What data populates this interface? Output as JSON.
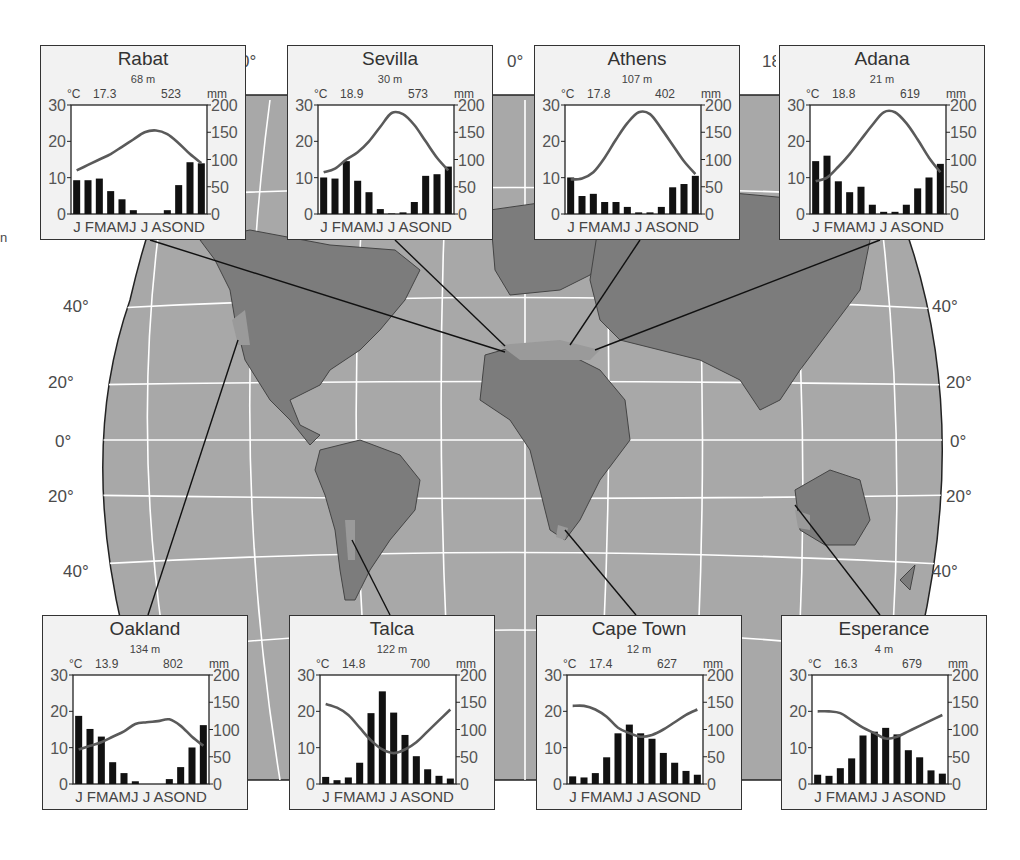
{
  "map": {
    "top_labels": [
      "0°",
      "0°",
      "18"
    ],
    "lat_labels_left": [
      "40°",
      "20°",
      "0°",
      "20°",
      "40°"
    ],
    "lat_labels_right": [
      "40°",
      "20°",
      "0°",
      "20°",
      "40°"
    ],
    "edge_fragment": "n",
    "colors": {
      "ocean": "#a8a8a8",
      "land": "#7c7c7c",
      "mediterranean_zone": "#9a9a9a",
      "grid": "#ffffff",
      "box_bg": "#f2f2f2",
      "bar": "#111111",
      "temp_line": "#5a5a5a"
    }
  },
  "chart_data": [
    {
      "type": "bar+line",
      "title": "Rabat",
      "elevation": "68 m",
      "annual_temp": "17.3",
      "annual_precip": "523",
      "temp_unit": "°C",
      "precip_unit": "mm",
      "categories": [
        "J",
        "F",
        "M",
        "A",
        "M",
        "J",
        "J",
        "A",
        "S",
        "O",
        "N",
        "D"
      ],
      "month_labels": "J FMAMJ J ASOND",
      "left_axis": {
        "label": "°C",
        "ticks": [
          0,
          10,
          20,
          30
        ],
        "range": [
          0,
          30
        ]
      },
      "right_axis": {
        "label": "mm",
        "ticks": [
          0,
          50,
          100,
          150,
          200
        ],
        "range": [
          0,
          200
        ]
      },
      "series": [
        {
          "name": "Precipitation (mm)",
          "type": "bar",
          "values": [
            62,
            62,
            65,
            42,
            27,
            7,
            0,
            0,
            7,
            53,
            95,
            93
          ]
        },
        {
          "name": "Temperature (°C)",
          "type": "line",
          "values": [
            12,
            13.5,
            15,
            16.5,
            18.5,
            20.5,
            22.5,
            23,
            22,
            19.5,
            16.5,
            14
          ]
        }
      ]
    },
    {
      "type": "bar+line",
      "title": "Sevilla",
      "elevation": "30 m",
      "annual_temp": "18.9",
      "annual_precip": "573",
      "temp_unit": "°C",
      "precip_unit": "mm",
      "categories": [
        "J",
        "F",
        "M",
        "A",
        "M",
        "J",
        "J",
        "A",
        "S",
        "O",
        "N",
        "D"
      ],
      "month_labels": "J FMAMJ J ASOND",
      "left_axis": {
        "label": "°C",
        "ticks": [
          0,
          10,
          20,
          30
        ],
        "range": [
          0,
          30
        ]
      },
      "right_axis": {
        "label": "mm",
        "ticks": [
          0,
          50,
          100,
          150,
          200
        ],
        "range": [
          0,
          200
        ]
      },
      "series": [
        {
          "name": "Precipitation (mm)",
          "type": "bar",
          "values": [
            67,
            65,
            97,
            61,
            40,
            9,
            1,
            3,
            22,
            70,
            73,
            87
          ]
        },
        {
          "name": "Temperature (°C)",
          "type": "line",
          "values": [
            11.5,
            12.5,
            15,
            17,
            20,
            24,
            27.8,
            27.5,
            24.5,
            20,
            15.5,
            12
          ]
        }
      ]
    },
    {
      "type": "bar+line",
      "title": "Athens",
      "elevation": "107 m",
      "annual_temp": "17.8",
      "annual_precip": "402",
      "temp_unit": "°C",
      "precip_unit": "mm",
      "categories": [
        "J",
        "F",
        "M",
        "A",
        "M",
        "J",
        "J",
        "A",
        "S",
        "O",
        "N",
        "D"
      ],
      "month_labels": "J FMAMJ J ASOND",
      "left_axis": {
        "label": "°C",
        "ticks": [
          0,
          10,
          20,
          30
        ],
        "range": [
          0,
          30
        ]
      },
      "right_axis": {
        "label": "mm",
        "ticks": [
          0,
          50,
          100,
          150,
          200
        ],
        "range": [
          0,
          200
        ]
      },
      "series": [
        {
          "name": "Precipitation (mm)",
          "type": "bar",
          "values": [
            67,
            33,
            37,
            22,
            22,
            13,
            3,
            3,
            13,
            49,
            55,
            70
          ]
        },
        {
          "name": "Temperature (°C)",
          "type": "line",
          "values": [
            9.5,
            9.8,
            11.5,
            15.5,
            20.5,
            25,
            28,
            27.5,
            23.5,
            19,
            14.5,
            11
          ]
        }
      ]
    },
    {
      "type": "bar+line",
      "title": "Adana",
      "elevation": "21 m",
      "annual_temp": "18.8",
      "annual_precip": "619",
      "temp_unit": "°C",
      "precip_unit": "mm",
      "categories": [
        "J",
        "F",
        "M",
        "A",
        "M",
        "J",
        "J",
        "A",
        "S",
        "O",
        "N",
        "D"
      ],
      "month_labels": "J FMAMJ J ASOND",
      "left_axis": {
        "label": "°C",
        "ticks": [
          0,
          10,
          20,
          30
        ],
        "range": [
          0,
          30
        ]
      },
      "right_axis": {
        "label": "mm",
        "ticks": [
          0,
          50,
          100,
          150,
          200
        ],
        "range": [
          0,
          200
        ]
      },
      "series": [
        {
          "name": "Precipitation (mm)",
          "type": "bar",
          "values": [
            97,
            107,
            60,
            40,
            50,
            17,
            4,
            4,
            17,
            47,
            67,
            92
          ]
        },
        {
          "name": "Temperature (°C)",
          "type": "line",
          "values": [
            9,
            10,
            13,
            16.5,
            20.5,
            24.5,
            28,
            28,
            25,
            20.5,
            15.5,
            11.5
          ]
        }
      ]
    },
    {
      "type": "bar+line",
      "title": "Oakland",
      "elevation": "134 m",
      "annual_temp": "13.9",
      "annual_precip": "802",
      "temp_unit": "°C",
      "precip_unit": "mm",
      "categories": [
        "J",
        "F",
        "M",
        "A",
        "M",
        "J",
        "J",
        "A",
        "S",
        "O",
        "N",
        "D"
      ],
      "month_labels": "J FMAMJ J ASOND",
      "left_axis": {
        "label": "°C",
        "ticks": [
          0,
          10,
          20,
          30
        ],
        "range": [
          0,
          30
        ]
      },
      "right_axis": {
        "label": "mm",
        "ticks": [
          0,
          50,
          100,
          150,
          200
        ],
        "range": [
          0,
          200
        ]
      },
      "series": [
        {
          "name": "Precipitation (mm)",
          "type": "bar",
          "values": [
            125,
            101,
            87,
            40,
            20,
            5,
            0,
            0,
            9,
            31,
            67,
            108
          ]
        },
        {
          "name": "Temperature (°C)",
          "type": "line",
          "values": [
            9.5,
            10.5,
            11.5,
            13,
            14.5,
            16.5,
            17,
            17.3,
            17.8,
            16,
            13,
            10.5
          ]
        }
      ]
    },
    {
      "type": "bar+line",
      "title": "Talca",
      "elevation": "122 m",
      "annual_temp": "14.8",
      "annual_precip": "700",
      "temp_unit": "°C",
      "precip_unit": "mm",
      "categories": [
        "J",
        "F",
        "M",
        "A",
        "M",
        "J",
        "J",
        "A",
        "S",
        "O",
        "N",
        "D"
      ],
      "month_labels": "J FMAMJ J ASOND",
      "left_axis": {
        "label": "°C",
        "ticks": [
          0,
          10,
          20,
          30
        ],
        "range": [
          0,
          30
        ]
      },
      "right_axis": {
        "label": "mm",
        "ticks": [
          0,
          50,
          100,
          150,
          200
        ],
        "range": [
          0,
          200
        ]
      },
      "series": [
        {
          "name": "Precipitation (mm)",
          "type": "bar",
          "values": [
            13,
            7,
            12,
            39,
            130,
            170,
            131,
            90,
            51,
            27,
            15,
            10
          ]
        },
        {
          "name": "Temperature (°C)",
          "type": "line",
          "values": [
            22,
            21,
            19,
            15.5,
            12,
            9.5,
            8.5,
            9.5,
            11.5,
            14.5,
            17.5,
            20.5
          ]
        }
      ]
    },
    {
      "type": "bar+line",
      "title": "Cape Town",
      "elevation": "12 m",
      "annual_temp": "17.4",
      "annual_precip": "627",
      "temp_unit": "°C",
      "precip_unit": "mm",
      "categories": [
        "J",
        "F",
        "M",
        "A",
        "M",
        "J",
        "J",
        "A",
        "S",
        "O",
        "N",
        "D"
      ],
      "month_labels": "J FMAMJ J ASOND",
      "left_axis": {
        "label": "°C",
        "ticks": [
          0,
          10,
          20,
          30
        ],
        "range": [
          0,
          30
        ]
      },
      "right_axis": {
        "label": "mm",
        "ticks": [
          0,
          50,
          100,
          150,
          200
        ],
        "range": [
          0,
          200
        ]
      },
      "series": [
        {
          "name": "Precipitation (mm)",
          "type": "bar",
          "values": [
            14,
            12,
            20,
            49,
            93,
            109,
            93,
            83,
            57,
            39,
            24,
            17
          ]
        },
        {
          "name": "Temperature (°C)",
          "type": "line",
          "values": [
            21.5,
            21.5,
            20.5,
            18.5,
            15.5,
            14,
            13,
            13.5,
            15,
            17,
            19,
            20.5
          ]
        }
      ]
    },
    {
      "type": "bar+line",
      "title": "Esperance",
      "elevation": "4 m",
      "annual_temp": "16.3",
      "annual_precip": "679",
      "temp_unit": "°C",
      "precip_unit": "mm",
      "categories": [
        "J",
        "F",
        "M",
        "A",
        "M",
        "J",
        "J",
        "A",
        "S",
        "O",
        "N",
        "D"
      ],
      "month_labels": "J FMAMJ J ASOND",
      "left_axis": {
        "label": "°C",
        "ticks": [
          0,
          10,
          20,
          30
        ],
        "range": [
          0,
          30
        ]
      },
      "right_axis": {
        "label": "mm",
        "ticks": [
          0,
          50,
          100,
          150,
          200
        ],
        "range": [
          0,
          200
        ]
      },
      "series": [
        {
          "name": "Precipitation (mm)",
          "type": "bar",
          "values": [
            17,
            15,
            29,
            47,
            89,
            96,
            103,
            91,
            62,
            49,
            25,
            19
          ]
        },
        {
          "name": "Temperature (°C)",
          "type": "line",
          "values": [
            20,
            20,
            19.5,
            17.5,
            15.5,
            14,
            12.5,
            13,
            14.5,
            16,
            17.5,
            19
          ]
        }
      ]
    }
  ]
}
